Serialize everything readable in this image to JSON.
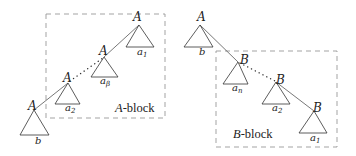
{
  "left_diagram": {
    "block_label_var": "A",
    "block_label_suffix": "-block",
    "nodes": [
      {
        "label": "A",
        "subtree": "a",
        "subtree_sub": "1"
      },
      {
        "label": "A",
        "subtree": "a",
        "subtree_sub": "β"
      },
      {
        "label": "A",
        "subtree": "a",
        "subtree_sub": "2"
      },
      {
        "label": "A",
        "subtree": "b",
        "subtree_sub": ""
      }
    ]
  },
  "right_diagram": {
    "block_label_var": "B",
    "block_label_suffix": "-block",
    "nodes": [
      {
        "label": "A",
        "subtree": "b",
        "subtree_sub": ""
      },
      {
        "label": "B",
        "subtree": "a",
        "subtree_sub": "n"
      },
      {
        "label": "B",
        "subtree": "a",
        "subtree_sub": "2"
      },
      {
        "label": "B",
        "subtree": "a",
        "subtree_sub": "1"
      }
    ]
  }
}
